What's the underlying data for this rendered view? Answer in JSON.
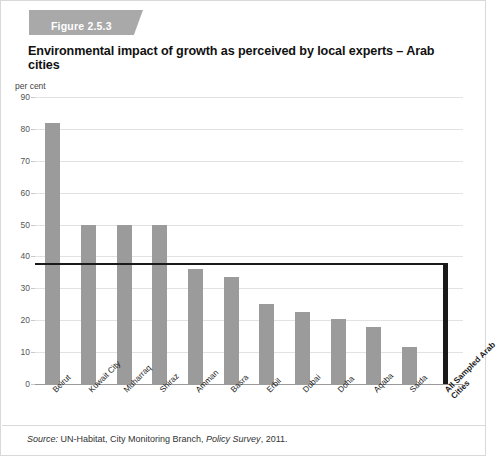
{
  "figure": {
    "badge": "Figure 2.5.3",
    "title": "Environmental impact of growth as perceived by local experts – Arab cities",
    "unit_label": "per cent",
    "source_prefix": "Source:",
    "source_body": " UN-Habitat, City Monitoring Branch, ",
    "source_italic": "Policy Survey",
    "source_suffix": ", 2011."
  },
  "colors": {
    "bar": "#9b9b9b",
    "highlight_bar": "#1a1a1a",
    "reference_line": "#1a1a1a",
    "grid": "#e2e2e2",
    "banner": "#a9a9a9",
    "background": "#ffffff"
  },
  "chart_data": {
    "type": "bar",
    "title": "Environmental impact of growth as perceived by local experts – Arab cities",
    "xlabel": "",
    "ylabel": "per cent",
    "ylim": [
      0,
      90
    ],
    "yticks": [
      0,
      10,
      20,
      30,
      40,
      50,
      60,
      70,
      80,
      90
    ],
    "grid": true,
    "legend": "none",
    "categories": [
      "Beirut",
      "Kuwait City",
      "Muharraq",
      "Shiraz",
      "Amman",
      "Basra",
      "Erbil",
      "Dubai",
      "Doha",
      "Aqaba",
      "Saida",
      "All Sampled Arab Cities"
    ],
    "values": [
      82,
      50,
      50,
      50,
      36,
      33.5,
      25,
      22.5,
      20.5,
      18,
      11.5,
      38
    ],
    "highlight_index": 11,
    "annotations": [
      {
        "type": "reference_line",
        "label": "All Sampled Arab Cities average",
        "value": 38
      }
    ]
  }
}
